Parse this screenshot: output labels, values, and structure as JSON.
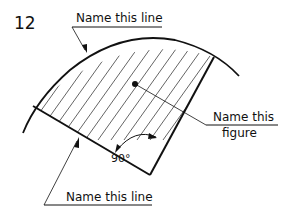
{
  "figure": {
    "number": "12",
    "labels": {
      "top_line": "Name this line",
      "figure_line1": "Name this",
      "figure_line2": "figure",
      "bottom_line": "Name this line",
      "angle": "90°"
    },
    "colors": {
      "ink": "#111111",
      "background": "#ffffff"
    }
  }
}
